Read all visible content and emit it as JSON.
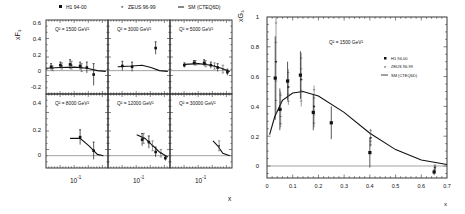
{
  "chart_data": [
    {
      "type": "scatter",
      "title": "xF3 vs x in Q2 bins",
      "xlabel": "x",
      "ylabel": "xF3",
      "xscale": "log",
      "legend": {
        "position": "top",
        "entries": [
          {
            "label": "H1 94-00",
            "marker": "square"
          },
          {
            "label": "ZEUS 96-99",
            "marker": "star"
          },
          {
            "label": "SM (CTEQ6D)",
            "marker": "line"
          }
        ]
      },
      "x_tick_labels": [
        "10^-1",
        "10^-1",
        "10^-1"
      ],
      "panels": [
        {
          "label": "Q² = 1500 GeV²",
          "row": 0,
          "col": 0,
          "ylim": [
            -0.3,
            0.65
          ],
          "yticks": [
            0.6,
            0.4,
            0.2,
            0,
            -0.2
          ],
          "h1": [
            [
              0.032,
              0.05,
              0.04
            ],
            [
              0.05,
              0.07,
              0.04
            ],
            [
              0.08,
              0.08,
              0.06
            ],
            [
              0.13,
              0.06,
              0.05
            ],
            [
              0.18,
              0.04,
              0.07
            ],
            [
              0.25,
              -0.05,
              0.14
            ]
          ],
          "zeus": [
            [
              0.032,
              0.03,
              0.03
            ],
            [
              0.05,
              0.06,
              0.04
            ],
            [
              0.08,
              0.07,
              0.05
            ],
            [
              0.13,
              0.04,
              0.05
            ]
          ],
          "sm": [
            [
              0.025,
              0.03
            ],
            [
              0.05,
              0.04
            ],
            [
              0.1,
              0.045
            ],
            [
              0.18,
              0.03
            ],
            [
              0.3,
              0.0
            ],
            [
              0.45,
              -0.01
            ]
          ]
        },
        {
          "label": "Q² = 3000 GeV²",
          "row": 0,
          "col": 1,
          "ylim": [
            -0.3,
            0.65
          ],
          "yticks": [],
          "h1": [
            [
              0.05,
              0.06,
              0.06
            ],
            [
              0.08,
              0.05,
              0.06
            ],
            [
              0.25,
              0.29,
              0.08
            ]
          ],
          "zeus": [],
          "sm": [
            [
              0.04,
              0.05
            ],
            [
              0.08,
              0.06
            ],
            [
              0.13,
              0.07
            ],
            [
              0.2,
              0.04
            ],
            [
              0.3,
              0.0
            ],
            [
              0.45,
              -0.01
            ]
          ]
        },
        {
          "label": "Q² = 5000 GeV²",
          "row": 0,
          "col": 2,
          "ylim": [
            -0.3,
            0.65
          ],
          "yticks": [],
          "h1": [
            [
              0.05,
              0.07,
              0.03
            ],
            [
              0.08,
              0.1,
              0.03
            ],
            [
              0.13,
              0.1,
              0.04
            ],
            [
              0.18,
              0.07,
              0.04
            ],
            [
              0.25,
              0.04,
              0.05
            ],
            [
              0.4,
              -0.02,
              0.04
            ]
          ],
          "zeus": [
            [
              0.08,
              0.1,
              0.03
            ],
            [
              0.13,
              0.09,
              0.04
            ],
            [
              0.2,
              0.06,
              0.04
            ],
            [
              0.3,
              0.02,
              0.05
            ]
          ],
          "sm": [
            [
              0.05,
              0.08
            ],
            [
              0.1,
              0.09
            ],
            [
              0.18,
              0.07
            ],
            [
              0.3,
              0.03
            ],
            [
              0.45,
              -0.01
            ]
          ]
        },
        {
          "label": "Q² = 8000 GeV²",
          "row": 1,
          "col": 0,
          "ylim": [
            -0.1,
            0.5
          ],
          "yticks": [
            0.4,
            0.2,
            0
          ],
          "h1": [
            [
              0.13,
              0.15,
              0.06
            ],
            [
              0.25,
              0.04,
              0.07
            ]
          ],
          "zeus": [],
          "sm": [
            [
              0.08,
              0.14
            ],
            [
              0.13,
              0.14
            ],
            [
              0.2,
              0.08
            ],
            [
              0.3,
              0.01
            ],
            [
              0.4,
              0.0
            ]
          ]
        },
        {
          "label": "Q² = 12000 GeV²",
          "row": 1,
          "col": 1,
          "ylim": [
            -0.1,
            0.5
          ],
          "yticks": [],
          "h1": [
            [
              0.13,
              0.13,
              0.05
            ],
            [
              0.18,
              0.11,
              0.05
            ],
            [
              0.25,
              0.03,
              0.04
            ],
            [
              0.4,
              -0.02,
              0.02
            ]
          ],
          "zeus": [
            [
              0.13,
              0.14,
              0.04
            ],
            [
              0.2,
              0.08,
              0.04
            ],
            [
              0.3,
              0.02,
              0.03
            ]
          ],
          "sm": [
            [
              0.1,
              0.17
            ],
            [
              0.15,
              0.14
            ],
            [
              0.22,
              0.08
            ],
            [
              0.3,
              0.03
            ],
            [
              0.45,
              -0.01
            ]
          ]
        },
        {
          "label": "Q² = 30000 GeV²",
          "row": 1,
          "col": 2,
          "ylim": [
            -0.1,
            0.5
          ],
          "yticks": [],
          "h1": [],
          "zeus": [
            [
              0.25,
              0.08,
              0.04
            ]
          ],
          "sm": [
            [
              0.2,
              0.12
            ],
            [
              0.25,
              0.08
            ],
            [
              0.32,
              0.02
            ],
            [
              0.45,
              0.0
            ]
          ]
        }
      ]
    },
    {
      "type": "scatter",
      "title": "Q² = 1500 GeV²",
      "xlabel": "x",
      "ylabel": "xG3",
      "xlim": [
        0,
        0.7
      ],
      "ylim": [
        -0.08,
        1.0
      ],
      "xticks": [
        0,
        0.1,
        0.2,
        0.3,
        0.4,
        0.5,
        0.6,
        0.7
      ],
      "yticks": [
        1,
        0.8,
        0.6,
        0.4,
        0.2,
        0
      ],
      "legend": {
        "position": "right-upper",
        "entries": [
          {
            "label": "H1 94-00",
            "marker": "square"
          },
          {
            "label": "ZEUS 96-99",
            "marker": "star"
          },
          {
            "label": "SM (CTEQ6D)",
            "marker": "line"
          }
        ]
      },
      "h1": [
        [
          0.032,
          0.59,
          0.28
        ],
        [
          0.05,
          0.38,
          0.14
        ],
        [
          0.08,
          0.57,
          0.13
        ],
        [
          0.13,
          0.61,
          0.16
        ],
        [
          0.18,
          0.36,
          0.12
        ],
        [
          0.25,
          0.29,
          0.11
        ],
        [
          0.4,
          0.09,
          0.1
        ],
        [
          0.65,
          -0.04,
          0.02
        ]
      ],
      "zeus": [
        [
          0.032,
          0.7,
          0.35
        ],
        [
          0.05,
          0.38,
          0.12
        ],
        [
          0.08,
          0.53,
          0.12
        ],
        [
          0.13,
          0.58,
          0.18
        ],
        [
          0.18,
          0.4,
          0.14
        ],
        [
          0.4,
          0.19,
          0.06
        ],
        [
          0.65,
          -0.01,
          0.02
        ]
      ],
      "sm": [
        [
          0.01,
          0.21
        ],
        [
          0.03,
          0.33
        ],
        [
          0.06,
          0.44
        ],
        [
          0.1,
          0.49
        ],
        [
          0.14,
          0.5
        ],
        [
          0.2,
          0.47
        ],
        [
          0.3,
          0.36
        ],
        [
          0.4,
          0.22
        ],
        [
          0.5,
          0.11
        ],
        [
          0.6,
          0.04
        ],
        [
          0.7,
          0.01
        ]
      ]
    }
  ],
  "figure": {
    "left": {
      "ylabel": "xF₃",
      "xlabel": "x",
      "legend": [
        "H1 94-00",
        "ZEUS 96-99",
        "SM (CTEQ6D)"
      ],
      "x_tick_label": "10",
      "x_tick_exp": "-1",
      "panel_labels": [
        "Q² = 1500 GeV²",
        "Q² = 3000 GeV²",
        "Q² = 5000 GeV²",
        "Q² = 8000 GeV²",
        "Q² = 12000 GeV²",
        "Q² = 30000 GeV²"
      ],
      "top_yticks": [
        "0.6",
        "0.4",
        "0.2",
        "0",
        "-0.2"
      ],
      "bottom_yticks": [
        "0.4",
        "0.2",
        "0"
      ]
    },
    "right": {
      "ylabel": "xG₃",
      "xlabel": "x",
      "title": "Q² = 1500 GeV²",
      "legend": [
        "H1 94-00",
        "ZEUS 96-99",
        "SM (CTEQ6D)"
      ],
      "yticks": [
        "1",
        "0.8",
        "0.6",
        "0.4",
        "0.2",
        "0"
      ],
      "xticks": [
        "0",
        "0.1",
        "0.2",
        "0.3",
        "0.4",
        "0.5",
        "0.6",
        "0.7"
      ]
    },
    "colors": {
      "ink": "#111111",
      "zero_line": "#666666",
      "background": "#ffffff"
    }
  }
}
